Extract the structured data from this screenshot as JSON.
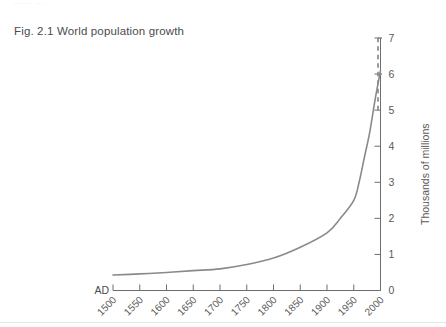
{
  "page": {
    "header_fragment": "······ ···",
    "title": "Fig. 2.1 World population growth"
  },
  "chart_data": {
    "type": "line",
    "title": "Fig. 2.1 World population growth",
    "xlabel": "",
    "ylabel": "Thousands of millions",
    "era_label": "AD",
    "grid": false,
    "legend": null,
    "axis_side_y": "right",
    "xlim": [
      1500,
      2000
    ],
    "ylim": [
      0,
      7
    ],
    "xticks": [
      1500,
      1550,
      1600,
      1650,
      1700,
      1750,
      1800,
      1850,
      1900,
      1950,
      2000
    ],
    "xtick_labels": [
      "1500",
      "1550",
      "1600",
      "1650",
      "1700",
      "1750",
      "1800",
      "1850",
      "1900",
      "1950",
      "2000"
    ],
    "yticks": [
      0,
      1,
      2,
      3,
      4,
      5,
      6,
      7
    ],
    "ytick_labels": [
      "0",
      "1",
      "2",
      "3",
      "4",
      "5",
      "6",
      "7"
    ],
    "series": [
      {
        "name": "World population",
        "style": "solid",
        "color": "#8a8a8a",
        "x": [
          1500,
          1550,
          1600,
          1650,
          1700,
          1750,
          1800,
          1850,
          1900,
          1925,
          1950,
          1960,
          1970,
          1980,
          1990,
          2000
        ],
        "values": [
          0.43,
          0.46,
          0.5,
          0.55,
          0.6,
          0.72,
          0.9,
          1.2,
          1.6,
          2.0,
          2.5,
          3.0,
          3.7,
          4.4,
          5.3,
          6.1
        ]
      },
      {
        "name": "Projection",
        "style": "dashed",
        "color": "#8a8a8a",
        "x": [
          2000,
          2000
        ],
        "values": [
          5.0,
          7.0
        ]
      }
    ],
    "annotations": [
      {
        "text": "AD",
        "role": "era-prefix",
        "at_x": 1500,
        "at_y": 0
      }
    ]
  }
}
